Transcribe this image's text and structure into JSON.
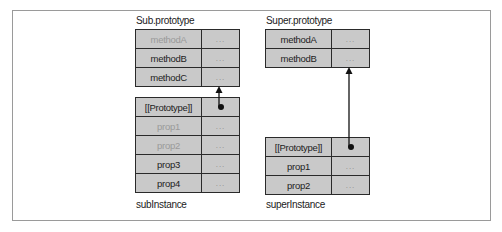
{
  "diagram": {
    "objects": {
      "sub_prototype": {
        "title": "Sub.prototype",
        "rows": [
          {
            "key": "methodA",
            "value": "...",
            "dimmed": true
          },
          {
            "key": "methodB",
            "value": "...",
            "dimmed": false
          },
          {
            "key": "methodC",
            "value": "...",
            "dimmed": false
          }
        ]
      },
      "sub_instance": {
        "title": "subInstance",
        "rows": [
          {
            "key": "[[Prototype]]",
            "value": "pointer",
            "dimmed": false
          },
          {
            "key": "prop1",
            "value": "...",
            "dimmed": true
          },
          {
            "key": "prop2",
            "value": "...",
            "dimmed": true
          },
          {
            "key": "prop3",
            "value": "...",
            "dimmed": false
          },
          {
            "key": "prop4",
            "value": "...",
            "dimmed": false
          }
        ]
      },
      "super_prototype": {
        "title": "Super.prototype",
        "rows": [
          {
            "key": "methodA",
            "value": "...",
            "dimmed": false
          },
          {
            "key": "methodB",
            "value": "...",
            "dimmed": false
          }
        ]
      },
      "super_instance": {
        "title": "superInstance",
        "rows": [
          {
            "key": "[[Prototype]]",
            "value": "pointer",
            "dimmed": false
          },
          {
            "key": "prop1",
            "value": "...",
            "dimmed": false
          },
          {
            "key": "prop2",
            "value": "...",
            "dimmed": false
          }
        ]
      }
    },
    "edges": [
      {
        "from": "subInstance.[[Prototype]]",
        "to": "Sub.prototype"
      },
      {
        "from": "superInstance.[[Prototype]]",
        "to": "Super.prototype"
      }
    ],
    "colors": {
      "cell_fill": "#c9c9c9",
      "border": "#2a2a2a",
      "dim_text": "#9a9a9a",
      "text": "#222222"
    }
  }
}
